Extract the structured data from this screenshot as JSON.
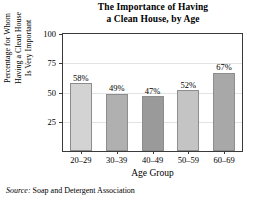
{
  "chart_data": {
    "type": "bar",
    "title": "The Importance of Having a Clean House, by Age",
    "title_lines": [
      "The Importance of Having",
      "a Clean House, by Age"
    ],
    "categories": [
      "20–29",
      "30–39",
      "40–49",
      "50–59",
      "60–69"
    ],
    "values": [
      58,
      49,
      47,
      52,
      67
    ],
    "value_labels": [
      "58%",
      "49%",
      "47%",
      "52%",
      "67%"
    ],
    "xlabel": "Age Group",
    "ylabel": "Percentage for Whom Having a Clean House Is Very Important",
    "ylabel_lines": [
      "Percentage for Whom",
      "Having a Clean House",
      "Is Very Important"
    ],
    "ylim": [
      0,
      100
    ],
    "yticks": [
      100,
      75,
      50,
      25
    ],
    "ytick_labels": [
      "100",
      "75",
      "50",
      "25"
    ],
    "grid": true,
    "grid_axis": "y",
    "legend": null,
    "bar_colors": [
      "#d3d3d3",
      "#b0b0b0",
      "#9a9a9a",
      "#c4c4c4",
      "#a8a8a8"
    ],
    "bar_edge_color": "#8d8d8d",
    "axis_color": "#3a3a3a",
    "grid_color": "#e3e3e3",
    "background_color": "#ffffff"
  },
  "source": {
    "label": "Source:",
    "text": "Soap and Detergent Association"
  }
}
